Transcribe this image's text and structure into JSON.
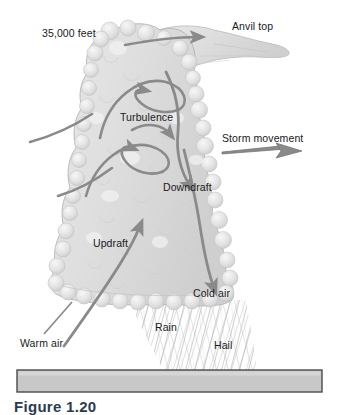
{
  "figure": {
    "caption": "Figure 1.20",
    "background_color": "#ffffff"
  },
  "labels": {
    "altitude": "35,000 feet",
    "anvil_top": "Anvil top",
    "turbulence": "Turbulence",
    "storm_movement": "Storm movement",
    "downdraft": "Downdraft",
    "updraft": "Updraft",
    "cold_air": "Cold air",
    "warm_air": "Warm air",
    "rain": "Rain",
    "hail": "Hail"
  },
  "colors": {
    "cloud_fill": "#dcdcdc",
    "cloud_edge": "#b4b4b4",
    "arrow": "#8a8a8a",
    "storm_arrow": "#6e6e6e",
    "ground_fill": "#c8c8c8",
    "ground_border": "#4a4a4a",
    "precip": "#b0b0b0",
    "text": "#1a1a1a",
    "caption_text": "#2d3a52"
  },
  "elements": {
    "ground_bar": "ground-surface",
    "precipitation_shaft": "rain-hail-shaft",
    "cloud_body": "cumulonimbus-cloud",
    "anvil": "anvil-top-cloud",
    "storm_movement_arrow": "storm-movement-arrow",
    "updraft_arrows": "updraft-arrows",
    "downdraft_arrow": "downdraft-arrow",
    "turbulence_arrows": "turbulence-curl-arrows",
    "anvil_outflow_arrow": "anvil-outflow-arrow"
  }
}
